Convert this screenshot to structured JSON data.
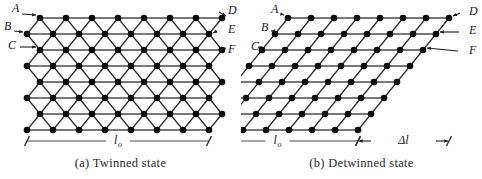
{
  "figure": {
    "panels": [
      {
        "id": "twinned",
        "caption": "(a) Twinned state",
        "labels_left": [
          "A",
          "B",
          "C"
        ],
        "labels_right": [
          "D",
          "E",
          "F"
        ],
        "dimensions": [
          {
            "symbol": "l",
            "subscript": "o"
          }
        ],
        "lattice": {
          "type": "zigzag-twinned",
          "rows": 8,
          "columns": 8,
          "row_spacing": 16,
          "column_spacing": 26,
          "zigzag_offset": 13,
          "origin_x": 27,
          "origin_y": 18
        }
      },
      {
        "id": "detwinned",
        "caption": "(b) Detwinned state",
        "labels_left": [
          "A",
          "B",
          "C"
        ],
        "labels_right": [
          "D",
          "E",
          "F"
        ],
        "dimensions": [
          {
            "symbol": "l",
            "subscript": "o"
          },
          {
            "symbol": "Δl",
            "subscript": ""
          }
        ],
        "lattice": {
          "type": "sheared-parallelogram",
          "rows": 8,
          "columns": 8,
          "row_spacing": 16,
          "column_spacing": 23,
          "shear_per_row": 13,
          "origin_x": 47,
          "origin_y": 18
        }
      }
    ],
    "colors": {
      "node": "#0b0b0b",
      "bond_horizontal": "#4a4a4a",
      "bond_diagonal": "#2b2b2b",
      "dimension": "#4d4d4d",
      "text": "#1a1a1a",
      "background": "#ffffff"
    }
  }
}
